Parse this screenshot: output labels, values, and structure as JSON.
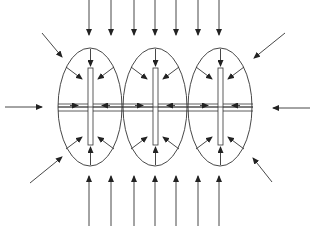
{
  "figure": {
    "type": "schematic",
    "line_color": "#333333",
    "ellipses": [
      {
        "cx": 90,
        "cy": 107,
        "rx": 32,
        "ry": 59
      },
      {
        "cx": 155,
        "cy": 107,
        "rx": 32,
        "ry": 59
      },
      {
        "cx": 220,
        "cy": 107,
        "rx": 32,
        "ry": 59
      }
    ],
    "bars": [
      {
        "x": 88,
        "y": 68,
        "w": 5,
        "h": 77
      },
      {
        "x": 153,
        "y": 68,
        "w": 5,
        "h": 77
      },
      {
        "x": 218,
        "y": 68,
        "w": 5,
        "h": 77
      }
    ],
    "strip": {
      "x1": 58,
      "x2": 253,
      "y_top": 104,
      "y_mid": 107,
      "y_bot": 111
    },
    "top_arrow_xs": [
      89,
      111,
      134,
      155,
      176,
      198,
      219
    ],
    "bottom_arrow_xs": [
      89,
      111,
      134,
      155,
      176,
      198,
      219
    ],
    "caption_visible": false
  },
  "caption": {
    "text": ""
  }
}
